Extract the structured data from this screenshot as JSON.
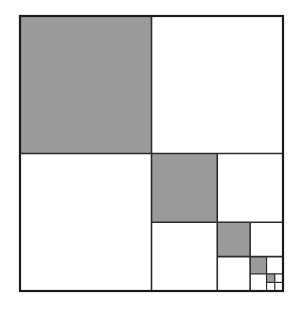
{
  "figure": {
    "title": "Recursive quadrant subdivision square",
    "type": "geometric-diagram"
  },
  "canvas": {
    "width": 300,
    "height": 312,
    "background_color": "#ffffff"
  },
  "outer_square": {
    "x": 20,
    "y": 16,
    "width": 263,
    "height": 275,
    "stroke_color": "#1a1a1a",
    "stroke_width": 2.2,
    "fill_color": "#ffffff"
  },
  "style": {
    "shaded_fill": "#9a9a9a",
    "empty_fill": "#ffffff",
    "line_color": "#2b2b2b",
    "inner_line_width": 1.6,
    "deep_line_width": 1.2
  },
  "recursion": {
    "levels": 5,
    "split_ratio": 0.5,
    "shaded_quadrant": "top-left",
    "recursive_quadrant": "bottom-right",
    "empty_quadrants": [
      "top-right",
      "bottom-left"
    ]
  },
  "chart_data": {
    "type": "area",
    "title": "Recursive quadrant subdivision square",
    "categories": [
      "level 1",
      "level 2",
      "level 3",
      "level 4",
      "level 5"
    ],
    "values": [
      0.25,
      0.0625,
      0.015625,
      0.00390625,
      0.0009765625
    ],
    "series": [
      {
        "name": "shaded area fraction of whole square",
        "values": [
          0.25,
          0.0625,
          0.015625,
          0.00390625,
          0.0009765625
        ]
      },
      {
        "name": "cumulative shaded fraction",
        "values": [
          0.25,
          0.3125,
          0.328125,
          0.33203125,
          0.3330078125
        ]
      }
    ],
    "xlabel": "recursion level",
    "ylabel": "fraction of total area",
    "ylim": [
      0,
      0.35
    ],
    "grid": false,
    "legend": "none",
    "annotations": [
      "each level shades 1/4 of the remaining lower-right square",
      "series converges to 1/3"
    ]
  },
  "levels": [
    {
      "index": 1,
      "square": {
        "x": 20,
        "y": 16,
        "w": 263,
        "h": 275
      },
      "shaded": {
        "x": 20,
        "y": 16,
        "w": 131.5,
        "h": 137.5
      },
      "area_fraction": "1/4",
      "label": "level-1"
    },
    {
      "index": 2,
      "square": {
        "x": 151.5,
        "y": 153.5,
        "w": 131.5,
        "h": 137.5
      },
      "shaded": {
        "x": 151.5,
        "y": 153.5,
        "w": 65.75,
        "h": 68.75
      },
      "area_fraction": "1/16",
      "label": "level-2"
    },
    {
      "index": 3,
      "square": {
        "x": 217.25,
        "y": 222.25,
        "w": 65.75,
        "h": 68.75
      },
      "shaded": {
        "x": 217.25,
        "y": 222.25,
        "w": 32.875,
        "h": 34.375
      },
      "area_fraction": "1/64",
      "label": "level-3"
    },
    {
      "index": 4,
      "square": {
        "x": 250.125,
        "y": 256.625,
        "w": 32.875,
        "h": 34.375
      },
      "shaded": {
        "x": 250.125,
        "y": 256.625,
        "w": 16.4375,
        "h": 17.1875
      },
      "area_fraction": "1/256",
      "label": "level-4"
    },
    {
      "index": 5,
      "square": {
        "x": 266.5625,
        "y": 273.8125,
        "w": 16.4375,
        "h": 17.1875
      },
      "shaded": {
        "x": 266.5625,
        "y": 273.8125,
        "w": 8.21875,
        "h": 8.59375
      },
      "area_fraction": "1/1024",
      "label": "level-5"
    }
  ]
}
